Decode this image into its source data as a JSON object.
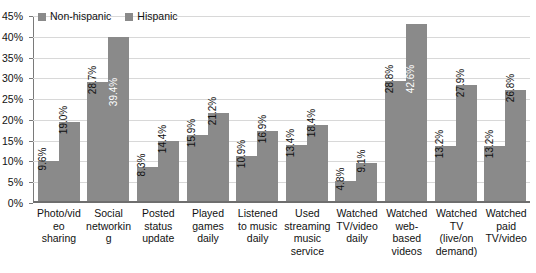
{
  "chart_data": {
    "type": "bar",
    "title": "",
    "xlabel": "",
    "ylabel": "",
    "ylim": [
      0,
      45
    ],
    "ytick_step": 5,
    "ytick_labels": [
      "45%",
      "40%",
      "35%",
      "30%",
      "25%",
      "20%",
      "15%",
      "10%",
      "5%",
      "0%"
    ],
    "grid": true,
    "legend_position": "top-left",
    "categories": [
      "Photo/video sharing",
      "Social networking",
      "Posted status update",
      "Played games daily",
      "Listened to music daily",
      "Used streaming music service",
      "Watched TV/video daily",
      "Watched web-based videos",
      "Watched TV (live/on demand)",
      "Watched paid TV/video"
    ],
    "series": [
      {
        "name": "Non-hispanic",
        "color": "#8a8a8a",
        "values": [
          9.6,
          28.7,
          8.3,
          15.9,
          10.9,
          13.4,
          4.8,
          28.8,
          13.2,
          13.2
        ],
        "labels": [
          "9.6%",
          "28.7%",
          "8.3%",
          "15.9%",
          "10.9%",
          "13.4%",
          "4.8%",
          "28.8%",
          "13.2%",
          "13.2%"
        ]
      },
      {
        "name": "Hispanic",
        "color": "#8a8a8a",
        "values": [
          19.0,
          39.4,
          14.4,
          21.2,
          16.9,
          18.4,
          9.1,
          42.6,
          27.9,
          26.8
        ],
        "labels": [
          "19.0%",
          "39.4%",
          "14.4%",
          "21.2%",
          "16.9%",
          "18.4%",
          "9.1%",
          "42.6%",
          "27.9%",
          "26.8%"
        ]
      }
    ],
    "label_inside_bar": {
      "series_1": [
        false,
        true,
        false,
        false,
        false,
        false,
        false,
        true,
        false,
        false
      ]
    }
  },
  "legend": {
    "items": [
      {
        "label": "Non-hispanic",
        "color": "#8a8a8a"
      },
      {
        "label": "Hispanic",
        "color": "#8a8a8a"
      }
    ]
  }
}
